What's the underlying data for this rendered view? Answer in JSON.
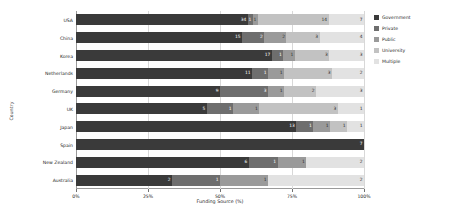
{
  "chart_data": {
    "type": "bar",
    "orientation": "horizontal",
    "stacked": true,
    "normalized_percent": true,
    "title": "",
    "xlabel": "Funding Source (%)",
    "ylabel": "Country",
    "xlim": [
      0,
      100
    ],
    "xticks": [
      "0%",
      "25%",
      "50%",
      "75%",
      "100%"
    ],
    "xtick_values": [
      0,
      25,
      50,
      75,
      100
    ],
    "grid": true,
    "legend_position": "right",
    "categories": [
      "USA",
      "China",
      "Korea",
      "Netherlands",
      "Germany",
      "UK",
      "Japan",
      "Spain",
      "New Zealand",
      "Australia"
    ],
    "series": [
      {
        "name": "Government",
        "color": "#3a3a3a",
        "values": [
          34,
          15,
          17,
          11,
          9,
          5,
          13,
          7,
          6,
          2
        ],
        "labels": [
          "34",
          "15",
          "17",
          "11",
          "9",
          "5",
          "13",
          "7",
          "6",
          "2"
        ]
      },
      {
        "name": "Private",
        "color": "#6e6e6e",
        "values": [
          1,
          2,
          1,
          1,
          3,
          1,
          1,
          0,
          1,
          1
        ],
        "labels": [
          "1",
          "2",
          "1",
          "1",
          "3",
          "1",
          "1",
          "",
          "1",
          "1"
        ]
      },
      {
        "name": "Public",
        "color": "#9a9a9a",
        "values": [
          1,
          2,
          1,
          1,
          1,
          1,
          1,
          0,
          1,
          1
        ],
        "labels": [
          "1",
          "2",
          "1",
          "1",
          "1",
          "1",
          "1",
          "",
          "1",
          "1"
        ]
      },
      {
        "name": "University",
        "color": "#c2c2c2",
        "values": [
          14,
          3,
          3,
          3,
          2,
          3,
          1,
          0,
          0,
          0
        ],
        "labels": [
          "14",
          "3",
          "3",
          "3",
          "2",
          "3",
          "1",
          "",
          "",
          ""
        ]
      },
      {
        "name": "Multiple",
        "color": "#e2e2e2",
        "values": [
          7,
          4,
          3,
          2,
          3,
          1,
          1,
          0,
          2,
          2
        ],
        "labels": [
          "7",
          "4",
          "3",
          "2",
          "3",
          "1",
          "1",
          "",
          "2",
          "2"
        ]
      }
    ]
  },
  "legend": {
    "items": [
      {
        "label": "Government",
        "color": "#3a3a3a"
      },
      {
        "label": "Private",
        "color": "#6e6e6e"
      },
      {
        "label": "Public",
        "color": "#9a9a9a"
      },
      {
        "label": "University",
        "color": "#c2c2c2"
      },
      {
        "label": "Multiple",
        "color": "#e2e2e2"
      }
    ]
  },
  "axes": {
    "x_title": "Funding Source (%)",
    "y_title": "Country"
  }
}
